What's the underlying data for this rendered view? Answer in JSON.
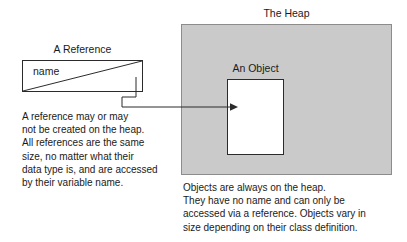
{
  "diagram": {
    "colors": {
      "heap_fill": "#cacaca",
      "heap_border": "#8c8c8c",
      "box_border": "#2b2b2b",
      "text": "#1a1a1a",
      "background": "#ffffff"
    }
  },
  "reference": {
    "title": "A Reference",
    "variable_label": "name",
    "note_lines": [
      "A reference may or may",
      "not be created on the heap.",
      "All references are the same",
      "size, no matter what their",
      "data type is, and are accessed",
      "by their variable name."
    ]
  },
  "heap": {
    "title": "The Heap",
    "object_title": "An Object",
    "note_lines": [
      "Objects are always on the heap.",
      "They have no name and can only be",
      "accessed via a reference. Objects vary in",
      "size depending on their class definition."
    ]
  },
  "connector": {
    "icon": "arrow-right-icon",
    "description": "reference points to object on heap"
  }
}
